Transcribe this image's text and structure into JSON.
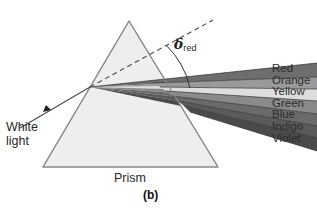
{
  "figure": {
    "caption": "(b)",
    "prism_label": "Prism",
    "source_label_line1": "White",
    "source_label_line2": "light",
    "deviation_symbol": "δ",
    "deviation_subscript": "red",
    "background_color": "#ffffff",
    "prism_fill_color": "#eeeeee",
    "prism_stroke_color": "#777777",
    "ray_color": "#555555",
    "dashed_line_color": "#555555",
    "arc_color": "#333333",
    "text_color": "#2a2a2a"
  },
  "legend": {
    "items": [
      {
        "label": "Red",
        "band_color": "#6e6e6e"
      },
      {
        "label": "Orange",
        "band_color": "#9a9a9a"
      },
      {
        "label": "Yellow",
        "band_color": "#dedede"
      },
      {
        "label": "Green",
        "band_color": "#8a8a8a"
      },
      {
        "label": "Blue",
        "band_color": "#6a6a6a"
      },
      {
        "label": "Indigo",
        "band_color": "#5a5a5a"
      },
      {
        "label": "Violet",
        "band_color": "#4a4a4a"
      }
    ]
  },
  "geometry": {
    "prism_apex": "129,21",
    "prism_bottom_left": "43,167",
    "prism_bottom_right": "218,167",
    "entry_point": "90,87",
    "incoming_ray_start": "20,128",
    "dashed_line_end": "213,20"
  }
}
